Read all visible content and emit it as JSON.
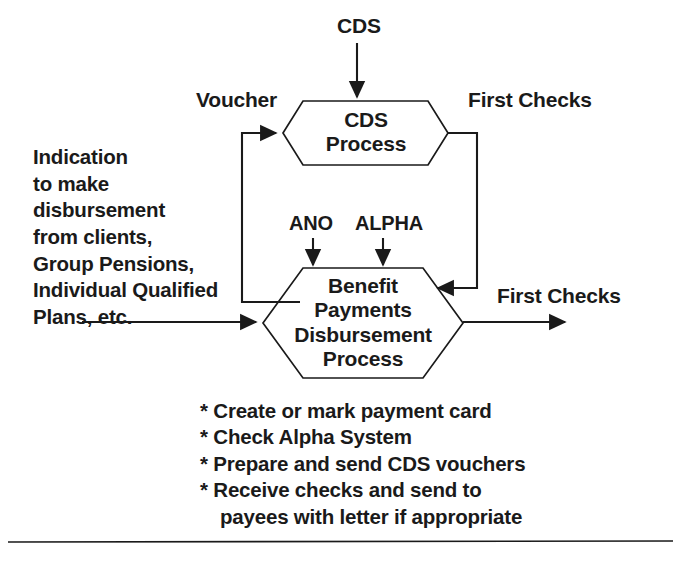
{
  "diagram": {
    "type": "process-flow",
    "colors": {
      "stroke": "#1a1a1a",
      "text": "#1a1a1a",
      "background": "#ffffff",
      "node_fill": "#ffffff"
    },
    "nodes": [
      {
        "id": "cds-process",
        "shape": "hexagon",
        "label": "CDS\nProcess",
        "lines": [
          "CDS",
          "Process"
        ]
      },
      {
        "id": "benefit-process",
        "shape": "hexagon",
        "label": "Benefit\nPayments\nDisbursement\nProcess",
        "lines": [
          "Benefit",
          "Payments",
          "Disbursement",
          "Process"
        ]
      }
    ],
    "flow_labels": {
      "cds_input": "CDS",
      "voucher": "Voucher",
      "first_checks_top": "First Checks",
      "ano": "ANO",
      "alpha": "ALPHA",
      "first_checks_right": "First Checks"
    },
    "input_note": {
      "lines": [
        "Indication",
        "to make",
        "disbursement",
        "from clients,",
        "Group Pensions,",
        "Individual Qualified",
        "Plans, etc."
      ]
    },
    "activities": {
      "bullet": "*",
      "items": [
        {
          "text": "Create or mark payment card",
          "continuation": ""
        },
        {
          "text": "Check Alpha System",
          "continuation": ""
        },
        {
          "text": "Prepare and send CDS vouchers",
          "continuation": ""
        },
        {
          "text": "Receive checks and send to",
          "continuation": "payees with letter if appropriate"
        }
      ]
    },
    "connections": [
      {
        "from": "CDS (external)",
        "to": "cds-process",
        "label": "CDS",
        "direction": "down"
      },
      {
        "from": "benefit-process",
        "to": "cds-process",
        "label": "Voucher",
        "direction": "up-left-loop"
      },
      {
        "from": "cds-process",
        "to": "benefit-process",
        "label": "First Checks",
        "direction": "down-right-loop"
      },
      {
        "from": "ANO (external)",
        "to": "benefit-process",
        "label": "ANO",
        "direction": "down"
      },
      {
        "from": "ALPHA (external)",
        "to": "benefit-process",
        "label": "ALPHA",
        "direction": "down"
      },
      {
        "from": "input note",
        "to": "benefit-process",
        "label": "",
        "direction": "right"
      },
      {
        "from": "benefit-process",
        "to": "output",
        "label": "First Checks",
        "direction": "right"
      }
    ]
  }
}
